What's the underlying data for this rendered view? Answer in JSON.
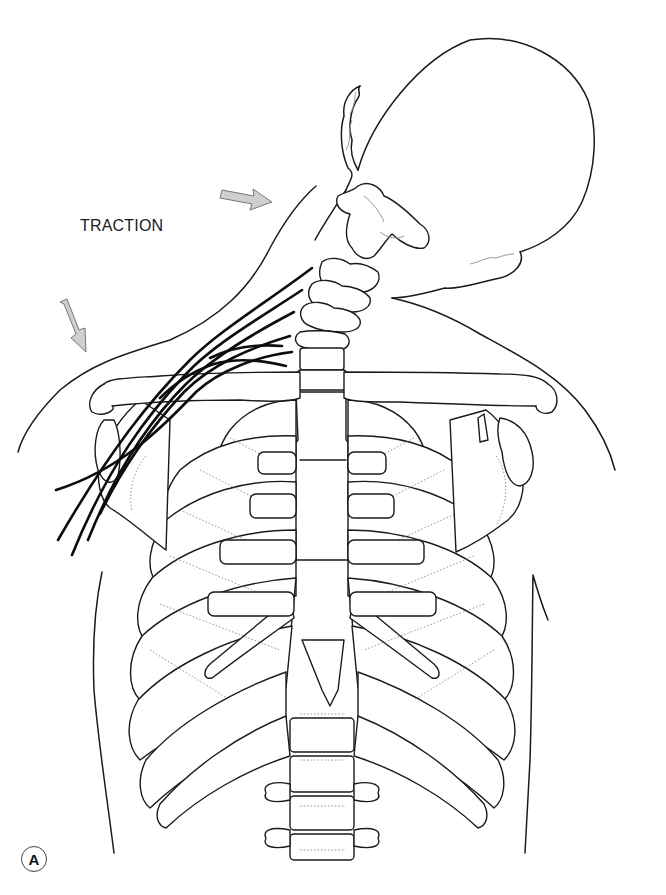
{
  "figure": {
    "panel_label": "A",
    "annotations": {
      "traction_label": "TRACTION",
      "arrows": [
        {
          "name": "head-traction-arrow",
          "direction": "toward head / right-up",
          "color": "#cfcfcf"
        },
        {
          "name": "shoulder-traction-arrow",
          "direction": "down on shoulder",
          "color": "#cfcfcf"
        }
      ]
    },
    "structures": [
      "head",
      "cervical vertebrae",
      "brachial plexus nerves",
      "clavicles",
      "scapulae",
      "sternum",
      "ribs",
      "thoracic vertebrae",
      "torso outline"
    ],
    "colors": {
      "line": "#1a1a1a",
      "nerve": "#0d0d0d",
      "arrow_fill": "#cfcfcf",
      "background": "#ffffff"
    }
  }
}
